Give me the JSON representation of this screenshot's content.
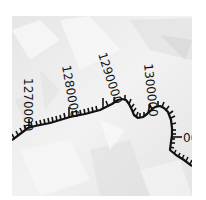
{
  "map": {
    "basemap": "hillshade",
    "colors": {
      "background": "#ffffff",
      "hillshade_base": "#ececec",
      "hillshade_light": "#f7f7f7",
      "hillshade_shadow": "#d6d6d6",
      "route_line": "#111111",
      "label": "#111111"
    },
    "route": {
      "type": "measured-line-with-hatch-ticks",
      "measure_labels": [
        {
          "text": "1270000"
        },
        {
          "text": "1280000"
        },
        {
          "text": "1290000"
        },
        {
          "text": "1300000"
        },
        {
          "text": "00"
        }
      ]
    }
  }
}
